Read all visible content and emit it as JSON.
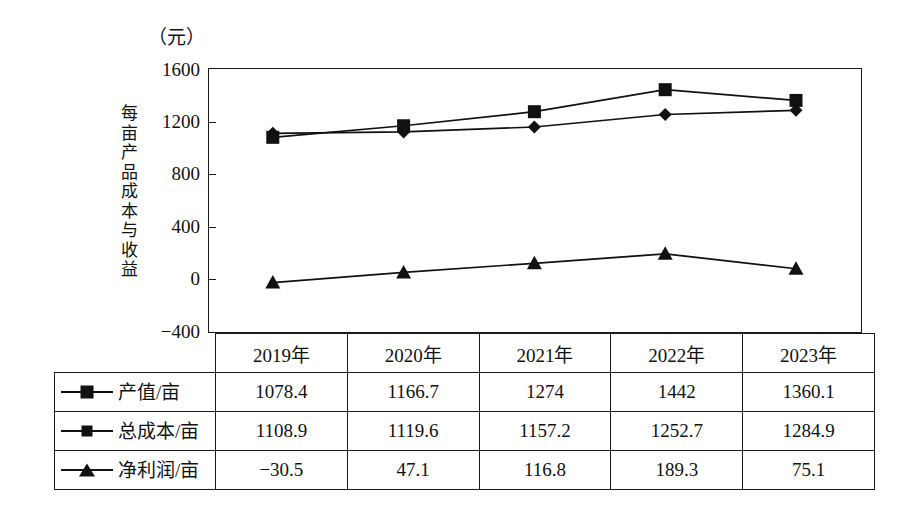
{
  "chart_data": {
    "type": "line",
    "title": "",
    "unit_label": "（元）",
    "ylabel": "每亩产品成本与收益",
    "xlabel": "",
    "categories": [
      "2019年",
      "2020年",
      "2021年",
      "2022年",
      "2023年"
    ],
    "ylim": [
      -400,
      1600
    ],
    "yticks": [
      1600,
      1200,
      800,
      400,
      0,
      -400
    ],
    "ytick_labels": [
      "1600",
      "1200",
      "800",
      "400",
      "0",
      "−400"
    ],
    "grid": false,
    "legend_position": "table-left-column",
    "series": [
      {
        "name": "产值/亩",
        "marker": "square",
        "values": [
          1078.4,
          1166.7,
          1274,
          1442,
          1360.1
        ],
        "value_labels": [
          "1078.4",
          "1166.7",
          "1274",
          "1442",
          "1360.1"
        ]
      },
      {
        "name": "总成本/亩",
        "marker": "diamond",
        "values": [
          1108.9,
          1119.6,
          1157.2,
          1252.7,
          1284.9
        ],
        "value_labels": [
          "1108.9",
          "1119.6",
          "1157.2",
          "1252.7",
          "1284.9"
        ]
      },
      {
        "name": "净利润/亩",
        "marker": "triangle",
        "values": [
          -30.5,
          47.1,
          116.8,
          189.3,
          75.1
        ],
        "value_labels": [
          "−30.5",
          "47.1",
          "116.8",
          "189.3",
          "75.1"
        ]
      }
    ],
    "colors": {
      "line": "#111111",
      "marker": "#111111",
      "frame": "#1a1a1a",
      "background": "#ffffff"
    }
  },
  "table": {
    "header": [
      "",
      "2019年",
      "2020年",
      "2021年",
      "2022年",
      "2023年"
    ],
    "rows": [
      {
        "label": "产值/亩",
        "marker": "square",
        "cells": [
          "1078.4",
          "1166.7",
          "1274",
          "1442",
          "1360.1"
        ]
      },
      {
        "label": "总成本/亩",
        "marker": "diamond",
        "cells": [
          "1108.9",
          "1119.6",
          "1157.2",
          "1252.7",
          "1284.9"
        ]
      },
      {
        "label": "净利润/亩",
        "marker": "triangle",
        "cells": [
          "−30.5",
          "47.1",
          "116.8",
          "189.3",
          "75.1"
        ]
      }
    ]
  }
}
